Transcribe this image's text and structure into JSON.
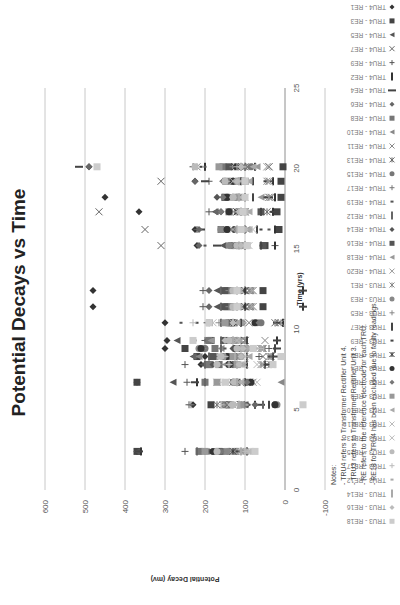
{
  "chart_data": {
    "type": "scatter",
    "title": "Potential Decays vs Time",
    "xlabel": "Time (yrs)",
    "ylabel": "Potential Decay (mv)",
    "xlim": [
      0,
      25
    ],
    "ylim": [
      -100,
      600
    ],
    "xticks": [
      "0",
      "5",
      "10",
      "15",
      "20",
      "25"
    ],
    "yticks": [
      "600",
      "500",
      "400",
      "300",
      "200",
      "100",
      "0",
      "-100"
    ],
    "grid": true,
    "legend_position": "right",
    "legend": [
      "TRU4 - RE1",
      "TRU4 - RE3",
      "TRU4 - RE5",
      "TRU4 - RE7",
      "TRU4 - RE9",
      "TRU4 - RE2",
      "TRU4 - RE4",
      "TRU4 - RE6",
      "TRU4 - RE8",
      "TRU4 - RE10",
      "TRU4 - RE11",
      "TRU4 - RE13",
      "TRU4 - RE15",
      "TRU4 - RE17",
      "TRU4 - RE19",
      "TRU4 - RE12",
      "TRU4 - RE14",
      "TRU4 - RE16",
      "TRU4 - RE18",
      "TRU4 - RE20",
      "TRU3 - RE1",
      "TRU3 - RE3",
      "TRU3 - RE5",
      "TRU3 - RE7",
      "TRU3 - RE9",
      "TRU3 - RE2",
      "TRU3 - RE4",
      "TRU3 - RE6",
      "TRU3 - RE8",
      "TRU3 - RE10",
      "TRU3 - RE11",
      "TRU3 - RE13",
      "TRU3 - RE15",
      "TRU3 - RE17",
      "TRU3 - RE12",
      "TRU3 - RE14",
      "TRU3 - RE16",
      "TRU3 - RE18"
    ],
    "times": [
      2.4,
      5.3,
      6.7,
      7.8,
      8.3,
      8.8,
      9.3,
      10.4,
      11.4,
      12.4,
      15.2,
      16.2,
      17.3,
      18.2,
      19.2,
      20.1
    ],
    "series": [
      {
        "name": "TRU4 - RE1",
        "marker": "diamond",
        "color": "#333333",
        "values": [
          370,
          230,
          370,
          210,
          200,
          300,
          295,
          300,
          480,
          480,
          220,
          225,
          365,
          450,
          225,
          490
        ]
      },
      {
        "name": "TRU4 - RE3",
        "marker": "square",
        "color": "#444444",
        "values": [
          370,
          185,
          370,
          190,
          220,
          250,
          185,
          135,
          55,
          55,
          50,
          15,
          20,
          10,
          10,
          5
        ]
      },
      {
        "name": "TRU4 - RE5",
        "marker": "triangle",
        "color": "#555555",
        "values": [
          370,
          100,
          280,
          205,
          230,
          210,
          270,
          190,
          170,
          170,
          155,
          150,
          175,
          130,
          140,
          105
        ]
      },
      {
        "name": "TRU4 - RE7",
        "marker": "x",
        "color": "#666666",
        "values": [
          135,
          110,
          90,
          45,
          55,
          55,
          100,
          15,
          90,
          90,
          310,
          350,
          465,
          35,
          310,
          40
        ]
      },
      {
        "name": "TRU4 - RE9",
        "marker": "plus",
        "color": "#555555",
        "values": [
          250,
          240,
          245,
          250,
          65,
          40,
          200,
          195,
          205,
          205,
          25,
          220,
          190,
          155,
          190,
          230
        ]
      },
      {
        "name": "TRU4 - RE2",
        "marker": "dash",
        "color": "#333333",
        "values": [
          360,
          75,
          220,
          50,
          30,
          25,
          20,
          5,
          -45,
          -45,
          25,
          25,
          30,
          25,
          30,
          200
        ]
      },
      {
        "name": "TRU4 - RE4",
        "marker": "bar",
        "color": "#444444",
        "values": [
          365,
          60,
          225,
          45,
          25,
          20,
          20,
          20,
          -45,
          -45,
          170,
          210,
          25,
          40,
          200,
          515
        ]
      },
      {
        "name": "TRU4 - RE6",
        "marker": "diamond",
        "color": "#666666",
        "values": [
          190,
          75,
          95,
          190,
          225,
          120,
          195,
          105,
          190,
          190,
          215,
          215,
          170,
          120,
          225,
          490
        ]
      },
      {
        "name": "TRU4 - RE8",
        "marker": "square",
        "color": "#777777",
        "values": [
          215,
          150,
          200,
          190,
          150,
          175,
          190,
          140,
          145,
          145,
          130,
          160,
          140,
          150,
          145,
          155
        ]
      },
      {
        "name": "TRU4 - RE10",
        "marker": "triangle",
        "color": "#888888",
        "values": [
          100,
          140,
          10,
          140,
          215,
          160,
          140,
          115,
          125,
          125,
          120,
          130,
          140,
          150,
          100,
          90
        ]
      },
      {
        "name": "TRU4 - RE11",
        "marker": "x",
        "color": "#888888",
        "values": [
          110,
          155,
          80,
          55,
          160,
          60,
          50,
          90,
          85,
          85,
          110,
          120,
          100,
          140,
          40,
          40
        ]
      },
      {
        "name": "TRU4 - RE13",
        "marker": "asterisk",
        "color": "#666666",
        "values": [
          125,
          170,
          130,
          35,
          35,
          85,
          100,
          25,
          80,
          80,
          110,
          120,
          45,
          110,
          115,
          100
        ]
      },
      {
        "name": "TRU4 - RE15",
        "marker": "circle",
        "color": "#777777",
        "values": [
          155,
          25,
          130,
          140,
          110,
          200,
          135,
          60,
          135,
          135,
          135,
          145,
          115,
          140,
          135,
          85
        ]
      },
      {
        "name": "TRU4 - RE17",
        "marker": "plus",
        "color": "#777777",
        "values": [
          140,
          235,
          100,
          120,
          170,
          50,
          120,
          190,
          110,
          110,
          120,
          100,
          110,
          120,
          150,
          125
        ]
      },
      {
        "name": "TRU4 - RE19",
        "marker": "dot",
        "color": "#555555",
        "values": [
          115,
          90,
          120,
          110,
          130,
          150,
          225,
          260,
          105,
          105,
          200,
          40,
          90,
          100,
          35,
          200
        ]
      },
      {
        "name": "TRU4 - RE12",
        "marker": "dash",
        "color": "#666666",
        "values": [
          220,
          55,
          200,
          200,
          190,
          160,
          160,
          160,
          160,
          160,
          100,
          100,
          110,
          100,
          110,
          100
        ]
      },
      {
        "name": "TRU4 - RE14",
        "marker": "diamond",
        "color": "#555555",
        "values": [
          200,
          95,
          90,
          180,
          140,
          130,
          120,
          110,
          140,
          140,
          125,
          130,
          160,
          170,
          155,
          110
        ]
      },
      {
        "name": "TRU4 - RE16",
        "marker": "square",
        "color": "#555555",
        "values": [
          165,
          140,
          120,
          165,
          180,
          120,
          150,
          130,
          150,
          150,
          55,
          105,
          60,
          150,
          110,
          140
        ]
      },
      {
        "name": "TRU4 - RE18",
        "marker": "triangle",
        "color": "#999999",
        "values": [
          125,
          110,
          150,
          150,
          135,
          90,
          185,
          110,
          120,
          120,
          110,
          95,
          105,
          60,
          100,
          70
        ]
      },
      {
        "name": "TRU4 - RE20",
        "marker": "x",
        "color": "#999999",
        "values": [
          130,
          150,
          170,
          105,
          120,
          70,
          100,
          90,
          90,
          90,
          130,
          110,
          120,
          40,
          40,
          45
        ]
      },
      {
        "name": "TRU3 - RE1",
        "marker": "asterisk",
        "color": "#888888",
        "values": [
          105,
          130,
          90,
          60,
          40,
          60,
          100,
          10,
          90,
          90,
          100,
          115,
          100,
          40,
          45,
          220
        ]
      },
      {
        "name": "TRU3 - RE3",
        "marker": "circle",
        "color": "#888888",
        "values": [
          145,
          20,
          100,
          130,
          120,
          215,
          130,
          70,
          130,
          130,
          140,
          160,
          120,
          130,
          130,
          110
        ]
      },
      {
        "name": "TRU3 - RE5",
        "marker": "plus",
        "color": "#888888",
        "values": [
          150,
          140,
          130,
          160,
          150,
          205,
          130,
          165,
          140,
          140,
          130,
          140,
          135,
          120,
          155,
          130
        ]
      },
      {
        "name": "TRU3 - RE7",
        "marker": "dash",
        "color": "#444444",
        "values": [
          95,
          40,
          100,
          95,
          95,
          25,
          95,
          110,
          100,
          100,
          60,
          70,
          60,
          80,
          80,
          75
        ]
      },
      {
        "name": "TRU3 - RE9",
        "marker": "dot",
        "color": "#444444",
        "values": [
          120,
          100,
          85,
          100,
          40,
          60,
          145,
          220,
          100,
          100,
          60,
          60,
          35,
          50,
          50,
          210
        ]
      },
      {
        "name": "TRU3 - RE2",
        "marker": "asterisk",
        "color": "#333333",
        "values": [
          130,
          110,
          95,
          130,
          130,
          120,
          110,
          120,
          100,
          100,
          110,
          120,
          120,
          115,
          120,
          125
        ]
      },
      {
        "name": "TRU3 - RE4",
        "marker": "circle",
        "color": "#333333",
        "values": [
          180,
          25,
          85,
          140,
          145,
          210,
          130,
          75,
          130,
          130,
          120,
          145,
          140,
          145,
          130,
          120
        ]
      },
      {
        "name": "TRU3 - RE6",
        "marker": "diamond",
        "color": "#777777",
        "values": [
          160,
          100,
          95,
          140,
          150,
          115,
          140,
          65,
          135,
          135,
          125,
          120,
          160,
          155,
          125,
          100
        ]
      },
      {
        "name": "TRU3 - RE8",
        "marker": "square",
        "color": "#999999",
        "values": [
          200,
          110,
          170,
          120,
          130,
          100,
          125,
          150,
          130,
          130,
          100,
          110,
          100,
          120,
          100,
          165
        ]
      },
      {
        "name": "TRU3 - RE10",
        "marker": "triangle",
        "color": "#aaaaaa",
        "values": [
          100,
          120,
          110,
          110,
          90,
          80,
          120,
          120,
          120,
          120,
          95,
          90,
          90,
          110,
          90,
          80
        ]
      },
      {
        "name": "TRU3 - RE11",
        "marker": "x",
        "color": "#bbbbbb",
        "values": [
          90,
          120,
          70,
          70,
          100,
          60,
          110,
          130,
          80,
          80,
          90,
          80,
          110,
          100,
          130,
          45
        ]
      },
      {
        "name": "TRU3 - RE13",
        "marker": "x",
        "color": "#bbbbbb",
        "values": [
          95,
          140,
          110,
          100,
          110,
          90,
          120,
          180,
          110,
          110,
          120,
          130,
          115,
          110,
          110,
          110
        ]
      },
      {
        "name": "TRU3 - RE15",
        "marker": "circle",
        "color": "#bbbbbb",
        "values": [
          170,
          130,
          125,
          170,
          160,
          120,
          140,
          190,
          130,
          130,
          120,
          115,
          100,
          130,
          150,
          225
        ]
      },
      {
        "name": "TRU3 - RE17",
        "marker": "plus",
        "color": "#bbbbbb",
        "values": [
          100,
          160,
          155,
          140,
          150,
          60,
          135,
          230,
          125,
          125,
          110,
          105,
          110,
          130,
          145,
          120
        ]
      },
      {
        "name": "TRU3 - RE12",
        "marker": "dot",
        "color": "#aaaaaa",
        "values": [
          110,
          95,
          115,
          115,
          105,
          95,
          110,
          100,
          110,
          110,
          100,
          90,
          105,
          105,
          110,
          100
        ]
      },
      {
        "name": "TRU3 - RE14",
        "marker": "dash",
        "color": "#aaaaaa",
        "values": [
          110,
          115,
          120,
          120,
          125,
          110,
          130,
          130,
          120,
          120,
          115,
          120,
          110,
          115,
          115,
          110
        ]
      },
      {
        "name": "TRU3 - RE16",
        "marker": "diamond",
        "color": "#bbbbbb",
        "values": [
          85,
          135,
          130,
          115,
          110,
          105,
          150,
          130,
          120,
          120,
          110,
          100,
          115,
          130,
          120,
          110
        ]
      },
      {
        "name": "TRU3 - RE18",
        "marker": "square",
        "color": "#cccccc",
        "values": [
          75,
          -45,
          150,
          30,
          10,
          80,
          230,
          190,
          120,
          120,
          95,
          110,
          105,
          100,
          100,
          470
        ]
      }
    ],
    "notes": {
      "heading": "Notes:",
      "lines": [
        "- TRU4 refers to Transformer Rectifier Unit 4.",
        "- TRU3 refers to Transformer Rectifier Unit 3.",
        "- RE refers to the reference electrode for each TRU.",
        "- RE18 for TRU4 has been excluded due to faulty readings."
      ]
    }
  }
}
